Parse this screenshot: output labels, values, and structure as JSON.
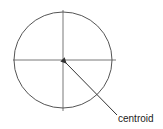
{
  "diagram": {
    "label": "centroid",
    "stroke_color": "#444444",
    "shapes": {
      "circle": {
        "cx": 63,
        "cy": 60,
        "rx": 49,
        "ry": 48
      },
      "horizontal_axis": {
        "x1": 13,
        "y1": 60,
        "x2": 116,
        "y2": 60
      },
      "vertical_axis": {
        "x1": 63,
        "y1": 10,
        "x2": 63,
        "y2": 111
      },
      "arrow": {
        "from": [
          117,
          115
        ],
        "to": [
          64,
          61
        ]
      }
    }
  }
}
